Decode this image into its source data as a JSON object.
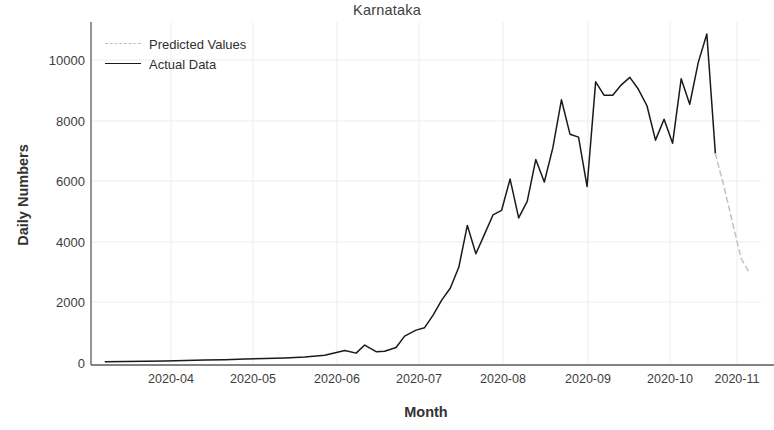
{
  "chart_data": {
    "type": "line",
    "title": "Karnataka",
    "xlabel": "Month",
    "ylabel": "Daily Numbers",
    "grid": true,
    "legend_position": "upper left",
    "xtick_labels": [
      "2020-04",
      "2020-05",
      "2020-06",
      "2020-07",
      "2020-08",
      "2020-09",
      "2020-10",
      "2020-11"
    ],
    "ytick_labels": [
      "0",
      "2000",
      "4000",
      "6000",
      "8000",
      "10000"
    ],
    "ytick_values": [
      0,
      2000,
      4000,
      6000,
      8000,
      10000
    ],
    "ylim": [
      0,
      11400
    ],
    "xlim": [
      "2020-03-15",
      "2020-11-05"
    ],
    "colors": {
      "actual": "#1a1a1a",
      "predicted": "#c2c2c2",
      "grid": "#ececec",
      "axis": "#555555",
      "text": "#3d3d3d"
    },
    "series": [
      {
        "name": "Actual Data",
        "style": "solid",
        "color": "#1a1a1a",
        "x": [
          "2020-03-20",
          "2020-03-27",
          "2020-04-03",
          "2020-04-10",
          "2020-04-17",
          "2020-04-24",
          "2020-05-01",
          "2020-05-08",
          "2020-05-15",
          "2020-05-22",
          "2020-05-29",
          "2020-06-05",
          "2020-06-12",
          "2020-06-16",
          "2020-06-19",
          "2020-06-23",
          "2020-06-26",
          "2020-06-30",
          "2020-07-03",
          "2020-07-07",
          "2020-07-10",
          "2020-07-13",
          "2020-07-16",
          "2020-07-19",
          "2020-07-22",
          "2020-07-25",
          "2020-07-28",
          "2020-07-31",
          "2020-08-03",
          "2020-08-06",
          "2020-08-09",
          "2020-08-12",
          "2020-08-15",
          "2020-08-18",
          "2020-08-21",
          "2020-08-24",
          "2020-08-27",
          "2020-08-30",
          "2020-09-02",
          "2020-09-05",
          "2020-09-08",
          "2020-09-11",
          "2020-09-14",
          "2020-09-17",
          "2020-09-20",
          "2020-09-23",
          "2020-09-26",
          "2020-09-29",
          "2020-10-02",
          "2020-10-05",
          "2020-10-08",
          "2020-10-11",
          "2020-10-14",
          "2020-10-17"
        ],
        "values": [
          40,
          50,
          60,
          70,
          80,
          100,
          110,
          130,
          150,
          170,
          200,
          260,
          420,
          330,
          600,
          380,
          390,
          520,
          900,
          1100,
          1180,
          1600,
          2100,
          2500,
          3200,
          4600,
          3650,
          4300,
          4950,
          5100,
          6150,
          4850,
          5400,
          6800,
          6050,
          7200,
          8800,
          7650,
          7550,
          5900,
          9400,
          8950,
          8950,
          9300,
          9550,
          9150,
          8600,
          7450,
          8150,
          7350,
          9500,
          8650,
          10050,
          11000
        ]
      },
      {
        "name": "Predicted Values",
        "style": "dashed",
        "color": "#c2c2c2",
        "x": [
          "2020-10-20",
          "2020-10-23",
          "2020-10-26",
          "2020-10-29",
          "2020-11-01"
        ],
        "values": [
          7000,
          5900,
          4700,
          3500,
          3000
        ]
      }
    ],
    "actual_tail": {
      "x": [
        "2020-10-17",
        "2020-10-20"
      ],
      "values": [
        11000,
        7000
      ],
      "note": "final solid segment before prediction begins"
    }
  },
  "legend": {
    "items": [
      {
        "label": "Predicted Values",
        "style": "dashed"
      },
      {
        "label": "Actual Data",
        "style": "solid"
      }
    ]
  }
}
